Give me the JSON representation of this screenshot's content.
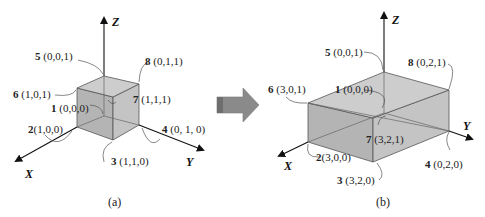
{
  "colors": {
    "face_top": "#c9c9c9",
    "face_left": "#b4b4b4",
    "face_right": "#c2c2c2",
    "edge": "#555555",
    "axis": "#111111",
    "arrow_fill": "#8a8a8a",
    "arrow_dark": "#6e6e6e"
  },
  "panel_a": {
    "caption": "(a)",
    "axes": {
      "x": "X",
      "y": "Y",
      "z": "Z"
    },
    "vertices": [
      {
        "id": "1",
        "coords": "(0,0,0)"
      },
      {
        "id": "2",
        "coords": "(1,0,0)"
      },
      {
        "id": "3",
        "coords": "(1,1,0)"
      },
      {
        "id": "4",
        "coords": "(0, 1, 0)"
      },
      {
        "id": "5",
        "coords": "(0,0,1)"
      },
      {
        "id": "6",
        "coords": "(1,0,1)"
      },
      {
        "id": "7",
        "coords": "(1,1,1)"
      },
      {
        "id": "8",
        "coords": "(0,1,1)"
      }
    ]
  },
  "panel_b": {
    "caption": "(b)",
    "axes": {
      "x": "X",
      "y": "Y",
      "z": "Z"
    },
    "vertices": [
      {
        "id": "1",
        "coords": "(0,0,0)"
      },
      {
        "id": "2",
        "coords": "(3,0,0)"
      },
      {
        "id": "3",
        "coords": "(3,2,0)"
      },
      {
        "id": "4",
        "coords": "(0,2,0)"
      },
      {
        "id": "5",
        "coords": "(0,0,1)"
      },
      {
        "id": "6",
        "coords": "(3,0,1)"
      },
      {
        "id": "7",
        "coords": "(3,2,1)"
      },
      {
        "id": "8",
        "coords": "(0,2,1)"
      }
    ]
  },
  "transform_arrow": {
    "direction": "right"
  }
}
